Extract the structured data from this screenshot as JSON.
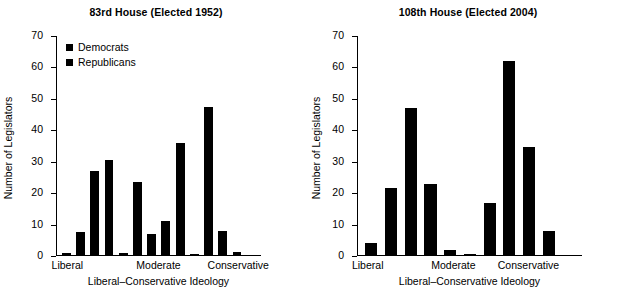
{
  "figure": {
    "panels": [
      {
        "title": "83rd House (Elected 1952)",
        "ylabel": "Number of Legislators",
        "xlabel": "Liberal–Conservative Ideology",
        "yticks": [
          "0",
          "10",
          "20",
          "30",
          "40",
          "50",
          "60",
          "70"
        ],
        "xticks": [
          "Liberal",
          "Moderate",
          "Conservative"
        ],
        "legend": [
          {
            "label": "Democrats",
            "color": "#000000",
            "marker": "square-marker"
          },
          {
            "label": "Republicans",
            "color": "#000000",
            "marker": "square-marker"
          }
        ]
      },
      {
        "title": "108th House (Elected 2004)",
        "ylabel": "Number of Legislators",
        "xlabel": "Liberal–Conservative Ideology",
        "yticks": [
          "0",
          "10",
          "20",
          "30",
          "40",
          "50",
          "60",
          "70"
        ],
        "xticks": [
          "Liberal",
          "Moderate",
          "Conservative"
        ],
        "legend": []
      }
    ]
  },
  "chart_data": [
    {
      "type": "bar",
      "title": "83rd House (Elected 1952)",
      "xlabel": "Liberal–Conservative Ideology",
      "ylabel": "Number of Legislators",
      "ylim": [
        0,
        70
      ],
      "yticks": [
        0,
        10,
        20,
        30,
        40,
        50,
        60,
        70
      ],
      "xtick_positions": [
        0.5,
        4.5,
        8.0
      ],
      "xtick_labels": [
        "Liberal",
        "Moderate",
        "Conservative"
      ],
      "grid": false,
      "legend_position": "upper-left",
      "bars": [
        {
          "index": 0,
          "value": 1,
          "series": "Democrats"
        },
        {
          "index": 1,
          "value": 7.5,
          "series": "Democrats"
        },
        {
          "index": 2,
          "value": 27,
          "series": "Democrats"
        },
        {
          "index": 3,
          "value": 30.5,
          "series": "Democrats"
        },
        {
          "index": 4,
          "value": 1,
          "series": "Republicans"
        },
        {
          "index": 5,
          "value": 23.5,
          "series": "Democrats"
        },
        {
          "index": 6,
          "value": 7,
          "series": "Republicans"
        },
        {
          "index": 7,
          "value": 11,
          "series": "Democrats"
        },
        {
          "index": 8,
          "value": 36,
          "series": "Republicans"
        },
        {
          "index": 9,
          "value": 0.7,
          "series": "Democrats"
        },
        {
          "index": 10,
          "value": 47.5,
          "series": "Republicans"
        },
        {
          "index": 11,
          "value": 8,
          "series": "Republicans"
        },
        {
          "index": 12,
          "value": 1.2,
          "series": "Republicans"
        }
      ],
      "series": [
        {
          "name": "Democrats",
          "color": "#000000"
        },
        {
          "name": "Republicans",
          "color": "#000000"
        }
      ]
    },
    {
      "type": "bar",
      "title": "108th House (Elected 2004)",
      "xlabel": "Liberal–Conservative Ideology",
      "ylabel": "Number of Legislators",
      "ylim": [
        0,
        70
      ],
      "yticks": [
        0,
        10,
        20,
        30,
        40,
        50,
        60,
        70
      ],
      "xtick_positions": [
        0.5,
        4.5,
        8.0
      ],
      "xtick_labels": [
        "Liberal",
        "Moderate",
        "Conservative"
      ],
      "grid": false,
      "legend_position": "none",
      "bars": [
        {
          "index": 0,
          "value": 4,
          "series": "Democrats"
        },
        {
          "index": 1,
          "value": 21.5,
          "series": "Democrats"
        },
        {
          "index": 2,
          "value": 47,
          "series": "Democrats"
        },
        {
          "index": 3,
          "value": 23,
          "series": "Democrats"
        },
        {
          "index": 4,
          "value": 2,
          "series": "Democrats"
        },
        {
          "index": 5,
          "value": 0.8,
          "series": "Republicans"
        },
        {
          "index": 6,
          "value": 17,
          "series": "Republicans"
        },
        {
          "index": 7,
          "value": 62,
          "series": "Republicans"
        },
        {
          "index": 8,
          "value": 34.8,
          "series": "Republicans"
        },
        {
          "index": 9,
          "value": 8,
          "series": "Republicans"
        }
      ],
      "series": [
        {
          "name": "Democrats",
          "color": "#000000"
        },
        {
          "name": "Republicans",
          "color": "#000000"
        }
      ]
    }
  ]
}
